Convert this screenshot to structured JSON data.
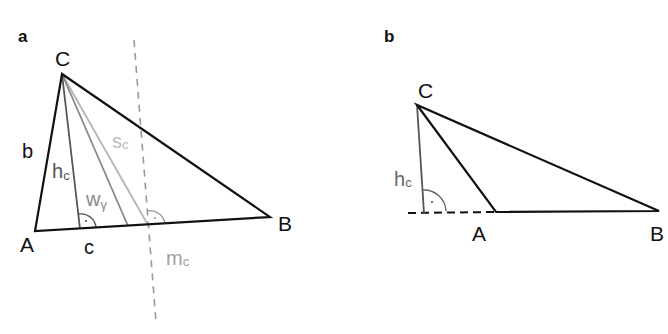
{
  "colors": {
    "black": "#111111",
    "dark_gray": "#555555",
    "mid_gray": "#888888",
    "light_gray": "#b5b5b5",
    "dashed_gray": "#999999"
  },
  "panel_a": {
    "label": "a",
    "vertices": {
      "C": {
        "label": "C",
        "x": 62,
        "y": 74
      },
      "A": {
        "label": "A",
        "x": 35,
        "y": 231
      },
      "B": {
        "label": "B",
        "x": 270,
        "y": 217
      }
    },
    "sides": {
      "b": "b",
      "c": "c"
    },
    "altitude": {
      "main": "h",
      "sub": "c",
      "foot_x": 80,
      "foot_y": 229
    },
    "angle_bisector": {
      "main": "w",
      "sub": "γ",
      "foot_x": 128,
      "foot_y": 226
    },
    "median": {
      "main": "s",
      "sub": "c",
      "foot_x": 148,
      "foot_y": 225
    },
    "perpendicular_bisector": {
      "main": "m",
      "sub": "c"
    }
  },
  "panel_b": {
    "label": "b",
    "vertices": {
      "C": {
        "label": "C",
        "x": 417,
        "y": 105
      },
      "A": {
        "label": "A",
        "x": 496,
        "y": 212
      },
      "B": {
        "label": "B",
        "x": 659,
        "y": 211
      }
    },
    "altitude": {
      "main": "h",
      "sub": "c",
      "foot_x": 424,
      "foot_y": 213
    },
    "extension_note": "dashed extension of AB"
  }
}
